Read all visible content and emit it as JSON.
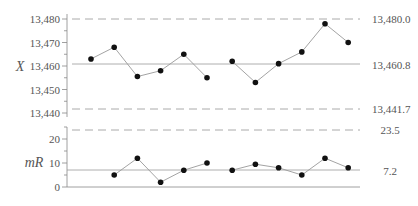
{
  "chart_data": [
    {
      "type": "line",
      "title": "",
      "ylabel": "X",
      "xlabel": "",
      "ylim": [
        13440,
        13480
      ],
      "y_ticks": [
        "13,440",
        "13,450",
        "13,460",
        "13,470",
        "13,480"
      ],
      "x": [
        1,
        2,
        3,
        4,
        5,
        6,
        7,
        8,
        9,
        10,
        11,
        12
      ],
      "values": [
        13463,
        13468,
        13455.5,
        13458,
        13465,
        13455,
        13462,
        13453,
        13461,
        13466,
        13478,
        13470
      ],
      "segment_break_after": 6,
      "control_lines": {
        "UCL": {
          "value": 13480.0,
          "label": "13,480.0",
          "style": "dashed"
        },
        "CL": {
          "value": 13460.8,
          "label": "13,460.8",
          "style": "solid"
        },
        "LCL": {
          "value": 13441.7,
          "label": "13,441.7",
          "style": "dashed"
        }
      },
      "grid": false
    },
    {
      "type": "line",
      "title": "",
      "ylabel": "mR",
      "xlabel": "",
      "ylim": [
        0,
        25
      ],
      "y_ticks": [
        "0",
        "10",
        "20"
      ],
      "x": [
        2,
        3,
        4,
        5,
        6,
        7,
        8,
        9,
        10,
        11,
        12
      ],
      "values": [
        5,
        12,
        2,
        7,
        10,
        7,
        9.5,
        8,
        5,
        12,
        8
      ],
      "segment_break_after": 5,
      "control_lines": {
        "UCL": {
          "value": 23.5,
          "label": "23.5",
          "style": "dashed"
        },
        "CL": {
          "value": 7.2,
          "label": "7.2",
          "style": "solid"
        }
      },
      "grid": false
    }
  ],
  "labels": {
    "x_axis_label": "X",
    "mr_axis_label": "mR",
    "x_ticks": [
      "13,480",
      "13,470",
      "13,460",
      "13,450",
      "13,440"
    ],
    "mr_ticks": [
      "20",
      "10",
      "0"
    ],
    "ucl_x": "13,480.0",
    "cl_x": "13,460.8",
    "lcl_x": "13,441.7",
    "ucl_mr": "23.5",
    "cl_mr": "7.2"
  }
}
